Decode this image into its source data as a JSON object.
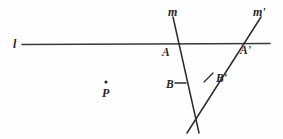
{
  "diagram": {
    "background_color": "#fefefe",
    "stroke_color": "#2b2b2b",
    "labels": {
      "line_l": "l",
      "line_m": "m",
      "line_m_prime": "m'",
      "point_A": "A",
      "point_A_prime": "A'",
      "point_B": "B",
      "point_B_prime": "B'",
      "point_P": "P"
    },
    "geometry": {
      "line_l": {
        "x1": 22,
        "y1": 44.5,
        "x2": 270,
        "y2": 43.5
      },
      "line_m": {
        "x1": 173,
        "y1": 17,
        "x2": 199,
        "y2": 133
      },
      "line_m_prime": {
        "x1": 261,
        "y1": 17,
        "x2": 187,
        "y2": 133
      },
      "point_A": {
        "x": 172,
        "y": 44
      },
      "point_A_prime": {
        "x": 238,
        "y": 44
      },
      "point_B": {
        "x": 181,
        "y": 83
      },
      "point_B_prime": {
        "x": 209,
        "y": 78
      },
      "point_P": {
        "x": 106,
        "y": 82
      },
      "crossing": {
        "x": 193,
        "y": 112
      },
      "tick_B": {
        "x1": 175,
        "y1": 83,
        "x2": 186,
        "y2": 83
      },
      "tick_B_prime": {
        "x1": 204,
        "y1": 82,
        "x2": 213,
        "y2": 73
      }
    }
  }
}
